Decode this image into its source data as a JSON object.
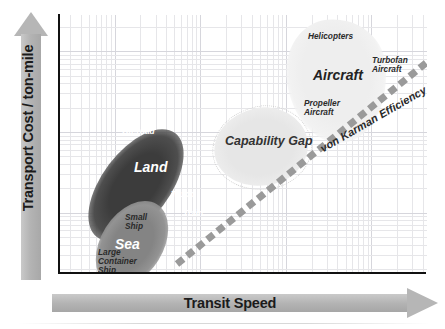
{
  "chart_data": {
    "type": "scatter",
    "title": "",
    "xlabel": "Transit Speed",
    "ylabel": "Transport Cost / ton-mile",
    "grid": true,
    "axis_style": "log-log grid, no tick labels",
    "legend": "none",
    "categories": [
      "Sea",
      "Land",
      "Capability Gap",
      "Aircraft"
    ],
    "clusters": [
      {
        "name": "Sea",
        "label": "Sea",
        "color": "#8a8a8a",
        "x_rel": 0.18,
        "y_rel": 0.18,
        "members": [
          "Large Container Ship",
          "Small Ship"
        ]
      },
      {
        "name": "Land",
        "label": "Land",
        "color": "#4a4a4a",
        "x_rel": 0.28,
        "y_rel": 0.52,
        "members": [
          "Off-road",
          "Truck",
          "Train"
        ]
      },
      {
        "name": "Capability Gap",
        "label": "Capability Gap",
        "color": "#e6e6e6",
        "x_rel": 0.55,
        "y_rel": 0.6,
        "members": []
      },
      {
        "name": "Aircraft",
        "label": "Aircraft",
        "color": "#efefef",
        "x_rel": 0.78,
        "y_rel": 0.82,
        "members": [
          "Helicopters",
          "Turbofan Aircraft",
          "Propeller Aircraft"
        ]
      }
    ],
    "annotations": [
      {
        "name": "von-karman-efficiency-limit",
        "text": "von Karman Efficiency Limit",
        "type": "dashed-diagonal-line",
        "color": "#9a9a9a",
        "from_rel": [
          0.32,
          0.04
        ],
        "to_rel": [
          1.0,
          0.81
        ]
      }
    ]
  },
  "axes": {
    "y": {
      "label": "Transport Cost / ton-mile",
      "arrow": "up-arrow-icon",
      "color": "#b4b4b4"
    },
    "x": {
      "label": "Transit Speed",
      "arrow": "right-arrow-icon",
      "color": "#b4b4b4"
    }
  },
  "clusters": {
    "aircraft": {
      "title": "Aircraft",
      "helicopters": "Helicopters",
      "turbofan_line1": "Turbofan",
      "turbofan_line2": "Aircraft",
      "propeller_line1": "Propeller",
      "propeller_line2": "Aircraft"
    },
    "gap": {
      "title": "Capability Gap"
    },
    "land": {
      "title": "Land",
      "offroad": "Off-road",
      "truck": "Truck",
      "train": "Train"
    },
    "sea": {
      "title": "Sea",
      "small_line1": "Small",
      "small_line2": "Ship",
      "large_line1": "Large",
      "large_line2": "Container",
      "large_line3": "Ship"
    }
  },
  "annotation": {
    "von_karman": "von Karman Efficiency Limit"
  }
}
